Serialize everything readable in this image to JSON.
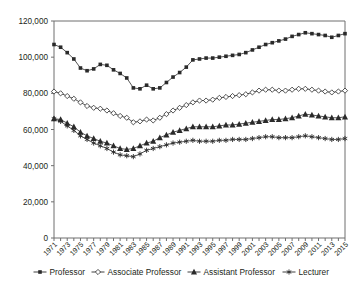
{
  "chart_data": {
    "type": "line",
    "title": "",
    "subtitle": "",
    "xlabel": "",
    "ylabel": "",
    "grid": false,
    "legend_position": "bottom",
    "xlim": [
      1971,
      2015
    ],
    "ylim": [
      0,
      120000
    ],
    "yticks": [
      0,
      20000,
      40000,
      60000,
      80000,
      100000,
      120000
    ],
    "ytick_labels": [
      "0",
      "20,000",
      "40,000",
      "60,000",
      "80,000",
      "100,000",
      "120,000"
    ],
    "x": [
      1971,
      1972,
      1973,
      1974,
      1975,
      1976,
      1977,
      1978,
      1979,
      1980,
      1981,
      1982,
      1983,
      1984,
      1985,
      1986,
      1987,
      1988,
      1989,
      1990,
      1991,
      1992,
      1993,
      1994,
      1995,
      1996,
      1997,
      1998,
      1999,
      2000,
      2001,
      2002,
      2003,
      2004,
      2005,
      2006,
      2007,
      2008,
      2009,
      2010,
      2011,
      2012,
      2013,
      2014,
      2015
    ],
    "xtick_labels": [
      "1971",
      "1973",
      "1975",
      "1977",
      "1979",
      "1981",
      "1983",
      "1985",
      "1987",
      "1989",
      "1991",
      "1993",
      "1995",
      "1997",
      "1999",
      "2001",
      "2003",
      "2005",
      "2007",
      "2009",
      "2011",
      "2013",
      "2015"
    ],
    "xtick_years": [
      1971,
      1973,
      1975,
      1977,
      1979,
      1981,
      1983,
      1985,
      1987,
      1989,
      1991,
      1993,
      1995,
      1997,
      1999,
      2001,
      2003,
      2005,
      2007,
      2009,
      2011,
      2013,
      2015
    ],
    "series": [
      {
        "name": "Professor",
        "marker": "filled-square",
        "color": "#2a2a2a",
        "values": [
          107000,
          105500,
          102500,
          99000,
          94000,
          92500,
          93500,
          96000,
          95500,
          93000,
          91000,
          88500,
          83000,
          82500,
          84500,
          82500,
          83000,
          86000,
          89000,
          91500,
          94500,
          98500,
          99000,
          99500,
          99500,
          100000,
          100500,
          101000,
          101500,
          102500,
          104000,
          105500,
          107000,
          108000,
          109000,
          110000,
          111500,
          112500,
          113500,
          113000,
          112500,
          112000,
          111000,
          112000,
          113000
        ]
      },
      {
        "name": "Associate Professor",
        "marker": "open-diamond",
        "color": "#2a2a2a",
        "values": [
          81000,
          80000,
          78500,
          77000,
          75000,
          73000,
          72000,
          71500,
          70500,
          69000,
          67500,
          66500,
          64000,
          64500,
          65500,
          65000,
          66500,
          68500,
          70500,
          72000,
          73500,
          75000,
          76000,
          76000,
          76500,
          77500,
          78000,
          78500,
          79000,
          79500,
          80500,
          81500,
          82000,
          82000,
          81500,
          81500,
          82000,
          82500,
          82500,
          82000,
          81500,
          81000,
          80500,
          81000,
          81500
        ]
      },
      {
        "name": "Assistant Professor",
        "marker": "filled-triangle",
        "color": "#2a2a2a",
        "values": [
          66000,
          65500,
          63500,
          61500,
          58500,
          56500,
          55000,
          53500,
          52500,
          51000,
          49500,
          49000,
          49500,
          51000,
          52500,
          53500,
          55500,
          57000,
          58500,
          59500,
          60500,
          61500,
          61500,
          61500,
          61500,
          62000,
          62500,
          62500,
          63000,
          63500,
          64000,
          64500,
          65000,
          65500,
          65500,
          66000,
          66500,
          67500,
          68500,
          68000,
          67500,
          67000,
          66500,
          66500,
          67000
        ]
      },
      {
        "name": "Lecturer",
        "marker": "asterisk",
        "color": "#2a2a2a",
        "values": [
          66000,
          64500,
          62000,
          59500,
          56500,
          54500,
          52500,
          51000,
          49500,
          47500,
          46000,
          45500,
          45000,
          46500,
          48500,
          49500,
          50500,
          51500,
          52500,
          53000,
          53500,
          54000,
          53500,
          53500,
          53500,
          54000,
          54000,
          54500,
          54500,
          54500,
          55000,
          55500,
          56000,
          56000,
          55500,
          55500,
          55500,
          56000,
          56500,
          56000,
          55500,
          55000,
          54500,
          54500,
          55000
        ]
      }
    ],
    "legend": [
      {
        "label": "Professor",
        "marker": "filled-square"
      },
      {
        "label": "Associate Professor",
        "marker": "open-diamond"
      },
      {
        "label": "Assistant Professor",
        "marker": "filled-triangle"
      },
      {
        "label": "Lecturer",
        "marker": "asterisk"
      }
    ]
  }
}
